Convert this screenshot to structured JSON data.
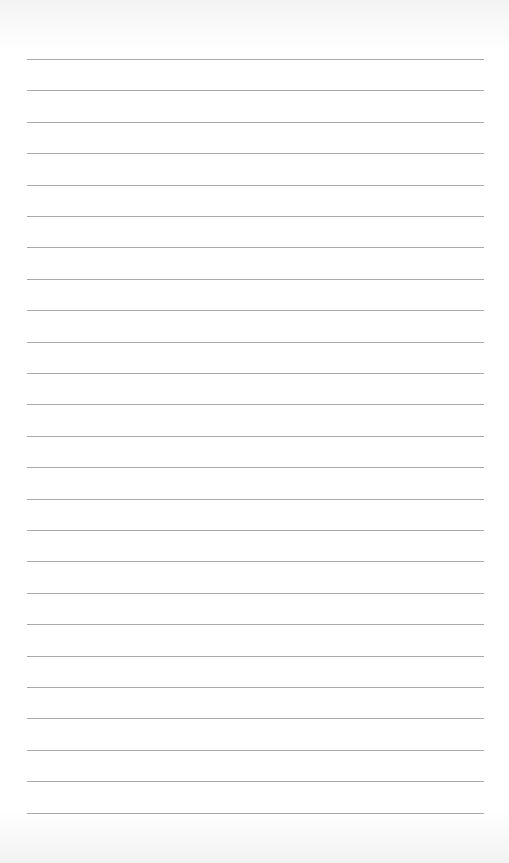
{
  "page": {
    "type": "blank-lined-paper",
    "line_color": "#9a9a9a",
    "background_color": "#ffffff",
    "line_count": 25,
    "first_line_y": 59,
    "line_spacing": 31.4,
    "line_left": 27,
    "line_right": 484
  }
}
